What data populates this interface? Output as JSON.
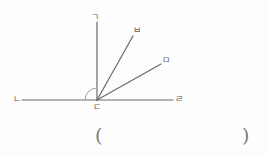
{
  "figure": {
    "type": "angle-diagram",
    "background_color": "#fdfdfd",
    "stroke_color": "#6a6a6a",
    "label_color": "#5d5d5d",
    "vertex": {
      "label": "ㄷ",
      "x": 97,
      "y": 100
    },
    "rays": [
      {
        "name": "ray-to-n",
        "label": "ㄴ",
        "from": [
          97,
          100
        ],
        "to": [
          22,
          100
        ],
        "label_pos": [
          13,
          95
        ]
      },
      {
        "name": "ray-to-g",
        "label": "ㄱ",
        "from": [
          97,
          100
        ],
        "to": [
          97,
          22
        ],
        "label_pos": [
          91,
          13
        ]
      },
      {
        "name": "ray-to-b",
        "label": "ㅂ",
        "from": [
          97,
          100
        ],
        "to": [
          133,
          36
        ],
        "label_pos": [
          133,
          26
        ]
      },
      {
        "name": "ray-to-m",
        "label": "ㅁ",
        "from": [
          97,
          100
        ],
        "to": [
          161,
          64
        ],
        "label_pos": [
          162,
          56
        ]
      },
      {
        "name": "ray-to-r",
        "label": "ㄹ",
        "from": [
          97,
          100
        ],
        "to": [
          173,
          100
        ],
        "label_pos": [
          175,
          95
        ]
      }
    ],
    "angle_arc": {
      "name": "angle-arc-n-d-g",
      "center": [
        97,
        100
      ],
      "radius": 12,
      "start_deg": 180,
      "end_deg": 90
    },
    "answer_field": {
      "open_paren": "(",
      "close_paren": ")",
      "value": ""
    }
  }
}
